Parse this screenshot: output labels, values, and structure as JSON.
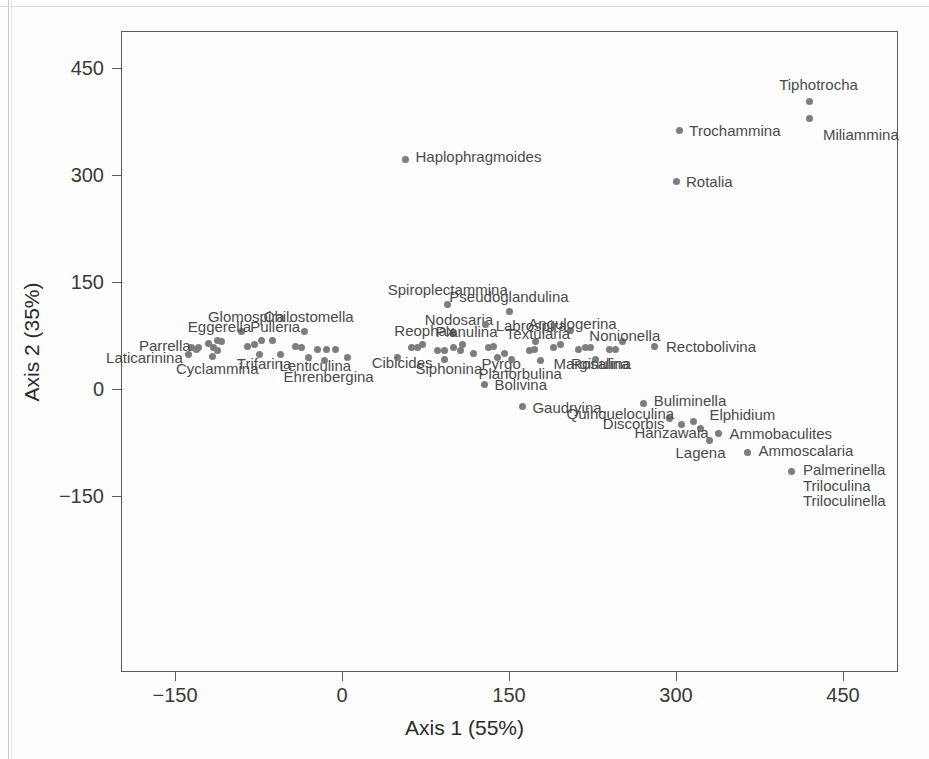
{
  "chart_data": {
    "type": "scatter",
    "title": "",
    "xlabel": "Axis 1 (55%)",
    "ylabel": "Axis 2 (35%)",
    "xticks": [
      -150,
      0,
      150,
      300,
      450
    ],
    "yticks": [
      -150,
      0,
      150,
      300,
      450
    ],
    "xlim": [
      -200,
      500
    ],
    "ylim": [
      -210,
      510
    ],
    "grid": false,
    "legend": "none",
    "point_color": "#7d7d7d",
    "axis_color": "#5a5a5a",
    "label_color": "#4a4a4a",
    "points": [
      {
        "label": "Tiphotrocha",
        "x": 420,
        "y": 403,
        "lx": 428,
        "ly": 427,
        "anchor": "mid"
      },
      {
        "label": "Miliammina",
        "x": 420,
        "y": 379,
        "lx": 432,
        "ly": 358,
        "anchor": "start"
      },
      {
        "label": "Trochammina",
        "x": 303,
        "y": 363,
        "lx": 312,
        "ly": 363,
        "anchor": "start"
      },
      {
        "label": "Rotalia",
        "x": 300,
        "y": 291,
        "lx": 309,
        "ly": 291,
        "anchor": "start"
      },
      {
        "label": "Haplophragmoides",
        "x": 57,
        "y": 322,
        "lx": 66,
        "ly": 326,
        "anchor": "start"
      },
      {
        "label": "Spiroplectammina",
        "x": 95,
        "y": 118,
        "lx": 95,
        "ly": 140,
        "anchor": "mid"
      },
      {
        "label": "Pseudoglandulina",
        "x": 150,
        "y": 108,
        "lx": 150,
        "ly": 130,
        "anchor": "mid"
      },
      {
        "label": "Glomospira",
        "x": -90,
        "y": 80,
        "lx": -86,
        "ly": 103,
        "anchor": "mid"
      },
      {
        "label": "Chilostomella",
        "x": -34,
        "y": 80,
        "lx": -30,
        "ly": 103,
        "anchor": "mid"
      },
      {
        "label": "Nodosaria",
        "x": 100,
        "y": 78,
        "lx": 105,
        "ly": 98,
        "anchor": "mid"
      },
      {
        "label": "Labrospira",
        "x": 129,
        "y": 90,
        "lx": 138,
        "ly": 90,
        "anchor": "start"
      },
      {
        "label": "Angulogerina",
        "x": 205,
        "y": 82,
        "lx": 207,
        "ly": 92,
        "anchor": "mid"
      },
      {
        "label": "Eggerella",
        "x": -112,
        "y": 68,
        "lx": -110,
        "ly": 88,
        "anchor": "mid"
      },
      {
        "label": "Pulleria",
        "x": -62,
        "y": 68,
        "lx": -60,
        "ly": 88,
        "anchor": "mid"
      },
      {
        "label": "Reophax",
        "x": 72,
        "y": 62,
        "lx": 74,
        "ly": 83,
        "anchor": "mid"
      },
      {
        "label": "Planulina",
        "x": 108,
        "y": 62,
        "lx": 112,
        "ly": 81,
        "anchor": "mid"
      },
      {
        "label": "Textularia",
        "x": 174,
        "y": 66,
        "lx": 176,
        "ly": 78,
        "anchor": "mid"
      },
      {
        "label": "Nonionella",
        "x": 252,
        "y": 66,
        "lx": 254,
        "ly": 76,
        "anchor": "mid"
      },
      {
        "label": "Parrella",
        "x": -129,
        "y": 58,
        "lx": -136,
        "ly": 62,
        "anchor": "end"
      },
      {
        "label": "Rectobolivina",
        "x": 281,
        "y": 60,
        "lx": 291,
        "ly": 60,
        "anchor": "start"
      },
      {
        "label": "Laticarinina",
        "x": -138,
        "y": 48,
        "lx": -143,
        "ly": 45,
        "anchor": "end"
      },
      {
        "label": "Cyclammina",
        "x": -116,
        "y": 46,
        "lx": -112,
        "ly": 30,
        "anchor": "mid"
      },
      {
        "label": "Trifarina",
        "x": -74,
        "y": 48,
        "lx": -70,
        "ly": 36,
        "anchor": "mid"
      },
      {
        "label": "Lenticulina",
        "x": -30,
        "y": 44,
        "lx": -24,
        "ly": 33,
        "anchor": "mid"
      },
      {
        "label": "Ehrenbergina",
        "x": -16,
        "y": 40,
        "lx": -12,
        "ly": 18,
        "anchor": "mid"
      },
      {
        "label": "Cibicides",
        "x": 50,
        "y": 44,
        "lx": 54,
        "ly": 38,
        "anchor": "mid"
      },
      {
        "label": "Siphonina",
        "x": 92,
        "y": 42,
        "lx": 96,
        "ly": 30,
        "anchor": "mid"
      },
      {
        "label": "Pyrgo",
        "x": 140,
        "y": 44,
        "lx": 143,
        "ly": 36,
        "anchor": "mid"
      },
      {
        "label": "Planorbulina",
        "x": 152,
        "y": 42,
        "lx": 160,
        "ly": 22,
        "anchor": "mid"
      },
      {
        "label": "Marginulina",
        "x": 178,
        "y": 40,
        "lx": 190,
        "ly": 36,
        "anchor": "start"
      },
      {
        "label": "Rosalina",
        "x": 228,
        "y": 42,
        "lx": 232,
        "ly": 36,
        "anchor": "mid"
      },
      {
        "label": "Bolivina",
        "x": 128,
        "y": 7,
        "lx": 137,
        "ly": 7,
        "anchor": "start"
      },
      {
        "label": "Gaudryina",
        "x": 162,
        "y": -25,
        "lx": 171,
        "ly": -25,
        "anchor": "start"
      },
      {
        "label": "Buliminella",
        "x": 271,
        "y": -21,
        "lx": 280,
        "ly": -15,
        "anchor": "start"
      },
      {
        "label": "Quinqueloculina",
        "x": 294,
        "y": -42,
        "lx": 250,
        "ly": -33,
        "anchor": "mid"
      },
      {
        "label": "Discorbis",
        "x": 305,
        "y": -50,
        "lx": 262,
        "ly": -48,
        "anchor": "mid"
      },
      {
        "label": "Elphidium",
        "x": 316,
        "y": -45,
        "lx": 330,
        "ly": -35,
        "anchor": "start"
      },
      {
        "label": "Hanzawaia",
        "x": 322,
        "y": -56,
        "lx": 296,
        "ly": -60,
        "anchor": "mid"
      },
      {
        "label": "Ammobaculites",
        "x": 338,
        "y": -62,
        "lx": 348,
        "ly": -62,
        "anchor": "start"
      },
      {
        "label": "Lagena",
        "x": 330,
        "y": -72,
        "lx": 322,
        "ly": -88,
        "anchor": "mid"
      },
      {
        "label": "Ammoscalaria",
        "x": 364,
        "y": -89,
        "lx": 374,
        "ly": -85,
        "anchor": "start"
      },
      {
        "label": "Palmerinella",
        "x": 404,
        "y": -116,
        "lx": 414,
        "ly": -112,
        "anchor": "start"
      },
      {
        "label": "Triloculina",
        "x": null,
        "y": null,
        "lx": 414,
        "ly": -134,
        "anchor": "start"
      },
      {
        "label": "Triloculinella",
        "x": null,
        "y": null,
        "lx": 414,
        "ly": -156,
        "anchor": "start"
      }
    ],
    "extra_points": [
      {
        "x": -135,
        "y": 58
      },
      {
        "x": -131,
        "y": 56
      },
      {
        "x": -120,
        "y": 64
      },
      {
        "x": -115,
        "y": 58
      },
      {
        "x": -112,
        "y": 54
      },
      {
        "x": -108,
        "y": 66
      },
      {
        "x": -85,
        "y": 60
      },
      {
        "x": -79,
        "y": 62
      },
      {
        "x": -72,
        "y": 68
      },
      {
        "x": -55,
        "y": 48
      },
      {
        "x": -42,
        "y": 60
      },
      {
        "x": -36,
        "y": 58
      },
      {
        "x": -22,
        "y": 56
      },
      {
        "x": -14,
        "y": 56
      },
      {
        "x": -6,
        "y": 56
      },
      {
        "x": 5,
        "y": 44
      },
      {
        "x": 62,
        "y": 58
      },
      {
        "x": 68,
        "y": 58
      },
      {
        "x": 86,
        "y": 54
      },
      {
        "x": 92,
        "y": 54
      },
      {
        "x": 100,
        "y": 58
      },
      {
        "x": 106,
        "y": 54
      },
      {
        "x": 118,
        "y": 50
      },
      {
        "x": 132,
        "y": 58
      },
      {
        "x": 136,
        "y": 60
      },
      {
        "x": 146,
        "y": 50
      },
      {
        "x": 168,
        "y": 54
      },
      {
        "x": 173,
        "y": 56
      },
      {
        "x": 190,
        "y": 58
      },
      {
        "x": 196,
        "y": 62
      },
      {
        "x": 212,
        "y": 56
      },
      {
        "x": 219,
        "y": 58
      },
      {
        "x": 223,
        "y": 58
      },
      {
        "x": 240,
        "y": 56
      },
      {
        "x": 246,
        "y": 56
      }
    ]
  },
  "axis": {
    "x_title": "Axis 1 (55%)",
    "y_title": "Axis 2 (35%)",
    "x_tick_labels": [
      "−150",
      "0",
      "150",
      "300",
      "450"
    ],
    "y_tick_labels": [
      "450",
      "300",
      "150",
      "0",
      "−150"
    ]
  }
}
